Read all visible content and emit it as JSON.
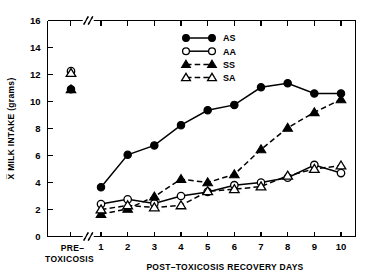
{
  "chart_data": {
    "type": "line",
    "title": "",
    "subtitle": "",
    "xlabel": "POST–TOXICOSIS RECOVERY DAYS",
    "ylabel": "X̅ MILK INTAKE (grams)",
    "xlim": [
      0,
      11
    ],
    "ylim": [
      0,
      16
    ],
    "grid": false,
    "legend_position": "top-center",
    "y_ticks": [
      0,
      2,
      4,
      6,
      8,
      10,
      12,
      14,
      16
    ],
    "y_tick_labels": [
      "0",
      "2",
      "4",
      "6",
      "8",
      "10",
      "12",
      "14",
      "16"
    ],
    "x_ticks": [
      1,
      2,
      3,
      4,
      5,
      6,
      7,
      8,
      9,
      10
    ],
    "x_tick_labels": [
      "1",
      "2",
      "3",
      "4",
      "5",
      "6",
      "7",
      "8",
      "9",
      "10"
    ],
    "pre_group_label_line1": "PRE–",
    "pre_group_label_line2": "TOXICOSIS",
    "axis_break": true,
    "categories": [
      1,
      2,
      3,
      4,
      5,
      6,
      7,
      8,
      9,
      10
    ],
    "series": [
      {
        "name": "AS",
        "marker": "filled-circle",
        "line": "solid",
        "pre_toxicosis": 10.9,
        "values": [
          3.65,
          6.05,
          6.75,
          8.25,
          9.35,
          9.75,
          11.05,
          11.35,
          10.6,
          10.6
        ]
      },
      {
        "name": "AA",
        "marker": "open-circle",
        "line": "solid",
        "pre_toxicosis": 12.25,
        "values": [
          2.4,
          2.75,
          2.45,
          3.0,
          3.3,
          3.8,
          4.0,
          4.35,
          5.3,
          4.7
        ]
      },
      {
        "name": "SS",
        "marker": "filled-triangle",
        "line": "dashed",
        "pre_toxicosis": 10.9,
        "values": [
          1.65,
          2.05,
          2.95,
          4.25,
          4.0,
          4.6,
          6.45,
          8.05,
          9.2,
          10.15
        ]
      },
      {
        "name": "SA",
        "marker": "open-triangle",
        "line": "dashed",
        "pre_toxicosis": 12.1,
        "values": [
          2.0,
          2.3,
          2.15,
          2.3,
          3.35,
          3.5,
          3.7,
          4.5,
          5.0,
          5.25
        ]
      }
    ],
    "legend": [
      {
        "label": "AS",
        "marker": "filled-circle",
        "line": "solid"
      },
      {
        "label": "AA",
        "marker": "open-circle",
        "line": "solid"
      },
      {
        "label": "SS",
        "marker": "filled-triangle",
        "line": "dashed"
      },
      {
        "label": "SA",
        "marker": "open-triangle",
        "line": "dashed"
      }
    ]
  }
}
